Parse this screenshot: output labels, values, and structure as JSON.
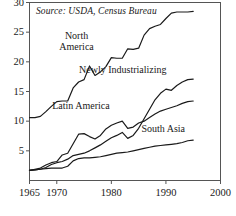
{
  "figure": {
    "source_note": "Source: USDA, Census Bureau",
    "background": "#ffffff",
    "line_color": "#1a1a1a",
    "axis_color": "#555555"
  },
  "chart_data": {
    "type": "line",
    "title": "",
    "subtitle": "",
    "xlabel": "",
    "ylabel": "",
    "annotations": [
      "Source: USDA, Census Bureau"
    ],
    "grid": false,
    "legend_position": "inline-labels",
    "xlim": [
      1965,
      2000
    ],
    "ylim": [
      0,
      30
    ],
    "xticks": [
      1965,
      1970,
      1980,
      1990,
      2000
    ],
    "xtick_labels": [
      "1965",
      "1970",
      "1980",
      "1990",
      "2000"
    ],
    "yticks": [
      5,
      10,
      15,
      20,
      25,
      30
    ],
    "ytick_labels": [
      "5",
      "10",
      "15",
      "20",
      "25",
      "30"
    ],
    "x": [
      1965,
      1966,
      1967,
      1968,
      1969,
      1970,
      1971,
      1972,
      1973,
      1974,
      1975,
      1976,
      1977,
      1978,
      1979,
      1980,
      1981,
      1982,
      1983,
      1984,
      1985,
      1986,
      1987,
      1988,
      1989,
      1990,
      1991,
      1992,
      1993,
      1994,
      1995
    ],
    "series": [
      {
        "name": "North America",
        "label": "North America",
        "label_x": 1974.5,
        "label_y": 24.3,
        "values": [
          10.6,
          10.6,
          10.8,
          11.6,
          12.5,
          13.3,
          13.4,
          13.4,
          15.6,
          16.6,
          17.0,
          19.3,
          17.7,
          18.3,
          19.2,
          20.7,
          20.6,
          20.6,
          22.2,
          22.1,
          22.3,
          24.5,
          25.6,
          26.0,
          26.3,
          27.3,
          28.2,
          28.4,
          28.4,
          28.4,
          28.5
        ]
      },
      {
        "name": "Latin America",
        "label": "Latin America",
        "label_x": 1975.0,
        "label_y": 12.6,
        "values": [
          1.7,
          1.9,
          2.1,
          2.6,
          3.0,
          3.2,
          4.3,
          4.6,
          6.2,
          7.8,
          7.9,
          7.4,
          7.0,
          7.6,
          8.7,
          9.3,
          9.7,
          10.0,
          8.8,
          9.0,
          9.7,
          10.0,
          10.6,
          11.2,
          11.7,
          12.0,
          12.3,
          12.6,
          13.0,
          13.3,
          13.4
        ]
      },
      {
        "name": "Newly Industrializing",
        "label": "Newly Industrializing",
        "label_x": 1983.5,
        "label_y": 18.6,
        "values": [
          1.7,
          1.8,
          1.9,
          2.2,
          2.7,
          3.0,
          3.2,
          3.6,
          4.2,
          4.4,
          4.6,
          5.0,
          5.5,
          6.0,
          6.6,
          7.2,
          7.6,
          8.1,
          7.1,
          7.6,
          8.8,
          10.4,
          12.0,
          13.6,
          14.7,
          15.4,
          15.2,
          16.0,
          16.6,
          17.0,
          17.1
        ]
      },
      {
        "name": "South Asia",
        "label": "South Asia",
        "label_x": 1990.0,
        "label_y": 8.7,
        "values": [
          1.7,
          1.8,
          1.9,
          2.0,
          2.1,
          2.1,
          2.1,
          2.4,
          3.3,
          3.7,
          3.8,
          3.8,
          3.9,
          4.0,
          4.2,
          4.4,
          4.6,
          4.7,
          4.8,
          5.0,
          5.2,
          5.4,
          5.6,
          5.8,
          5.9,
          6.0,
          6.1,
          6.2,
          6.4,
          6.7,
          6.8
        ]
      }
    ]
  }
}
